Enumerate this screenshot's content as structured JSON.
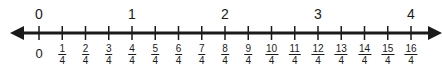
{
  "number_line": {
    "min": 0,
    "max": 4,
    "step": "1/4",
    "whole_labels": [
      "0",
      "1",
      "2",
      "3",
      "4"
    ],
    "zero_label": "0",
    "fractions": [
      {
        "num": "1",
        "den": "4"
      },
      {
        "num": "2",
        "den": "4"
      },
      {
        "num": "3",
        "den": "4"
      },
      {
        "num": "4",
        "den": "4"
      },
      {
        "num": "5",
        "den": "4"
      },
      {
        "num": "6",
        "den": "4"
      },
      {
        "num": "7",
        "den": "4"
      },
      {
        "num": "8",
        "den": "4"
      },
      {
        "num": "9",
        "den": "4"
      },
      {
        "num": "10",
        "den": "4"
      },
      {
        "num": "11",
        "den": "4"
      },
      {
        "num": "12",
        "den": "4"
      },
      {
        "num": "13",
        "den": "4"
      },
      {
        "num": "14",
        "den": "4"
      },
      {
        "num": "15",
        "den": "4"
      },
      {
        "num": "16",
        "den": "4"
      }
    ],
    "line_color": "#1a1a1a"
  }
}
